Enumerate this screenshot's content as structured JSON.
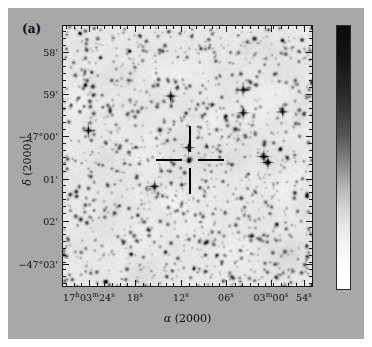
{
  "figure": {
    "panel_label": "(a)",
    "background_color": "#a8a8a8",
    "frame_color": "#1a1a1a"
  },
  "axes": {
    "xlabel_alpha": "α",
    "xlabel_epoch": "(2000)",
    "ylabel_delta": "δ",
    "ylabel_epoch": "(2000)"
  },
  "xticks": [
    {
      "label_main": "17",
      "sup1": "h",
      "label_mid": "03",
      "sup2": "m",
      "label_end": "24",
      "sup3": "s",
      "px": 89
    },
    {
      "label_main": "",
      "sup1": "",
      "label_mid": "",
      "sup2": "",
      "label_end": "18",
      "sup3": "s",
      "px": 135
    },
    {
      "label_main": "",
      "sup1": "",
      "label_mid": "",
      "sup2": "",
      "label_end": "12",
      "sup3": "s",
      "px": 181
    },
    {
      "label_main": "",
      "sup1": "",
      "label_mid": "",
      "sup2": "",
      "label_end": "06",
      "sup3": "s",
      "px": 226
    },
    {
      "label_main": "",
      "sup1": "",
      "label_mid": "03",
      "sup2": "m",
      "label_end": "00",
      "sup3": "s",
      "px": 271
    },
    {
      "label_main": "",
      "sup1": "",
      "label_mid": "",
      "sup2": "",
      "label_end": "54",
      "sup3": "s",
      "px": 304
    }
  ],
  "yticks": [
    {
      "label": "58'",
      "px": 52
    },
    {
      "label": "59'",
      "px": 94
    },
    {
      "label": "−47°00'",
      "px": 136
    },
    {
      "label": "01'",
      "px": 179
    },
    {
      "label": "02'",
      "px": 221
    },
    {
      "label": "−47°03'",
      "px": 264
    }
  ],
  "marker": {
    "name": "crosshair-target",
    "center_x": 189,
    "center_y": 159,
    "arm_length": 26,
    "gap": 8,
    "color": "#000000"
  },
  "colorbar": {
    "orientation": "vertical",
    "top_color": "#0a0a0a",
    "bottom_color": "#ffffff",
    "has_ticks": false
  },
  "chart_data": {
    "type": "scatter",
    "title": "(a)",
    "xlabel": "α (2000)",
    "ylabel": "δ (2000)",
    "grid": false,
    "legend": "none",
    "x_tick_labels": [
      "17h03m24s",
      "18s",
      "12s",
      "06s",
      "03m00s",
      "54s"
    ],
    "y_tick_labels": [
      "58'",
      "59'",
      "-47°00'",
      "01'",
      "02'",
      "-47°03'"
    ],
    "xlim": [
      "17h03m27s",
      "17h02m51s"
    ],
    "ylim": [
      "-47°03'30\"",
      "-46°57'30\""
    ],
    "marker_position": {
      "ra": "17h03m10s",
      "dec": "-47°00'30\""
    },
    "bright_stars": [
      [
        0.093,
        0.09,
        2.0
      ],
      [
        0.306,
        0.036,
        1.9
      ],
      [
        0.552,
        0.085,
        1.8
      ],
      [
        0.767,
        0.047,
        2.8
      ],
      [
        0.118,
        0.231,
        2.7
      ],
      [
        0.382,
        0.204,
        2.0
      ],
      [
        0.432,
        0.268,
        3.6
      ],
      [
        0.723,
        0.243,
        3.2
      ],
      [
        0.262,
        0.207,
        1.6
      ],
      [
        0.88,
        0.327,
        3.0
      ],
      [
        0.722,
        0.333,
        3.3
      ],
      [
        0.101,
        0.4,
        3.4
      ],
      [
        0.387,
        0.398,
        2.8
      ],
      [
        0.69,
        0.395,
        2.6
      ],
      [
        0.503,
        0.467,
        3.0
      ],
      [
        0.574,
        0.462,
        1.7
      ],
      [
        0.803,
        0.5,
        3.8
      ],
      [
        0.82,
        0.523,
        3.4
      ],
      [
        0.393,
        0.556,
        1.6
      ],
      [
        0.365,
        0.616,
        3.2
      ],
      [
        0.051,
        0.635,
        2.4
      ],
      [
        0.028,
        0.646,
        2.2
      ],
      [
        0.929,
        0.64,
        2.3
      ],
      [
        0.714,
        0.66,
        2.2
      ],
      [
        0.205,
        0.718,
        2.1
      ],
      [
        0.069,
        0.742,
        2.5
      ],
      [
        0.094,
        0.755,
        2.2
      ],
      [
        0.856,
        0.762,
        2.4
      ],
      [
        0.757,
        0.805,
        2.6
      ],
      [
        0.577,
        0.828,
        2.2
      ],
      [
        0.272,
        0.876,
        1.9
      ],
      [
        0.636,
        0.905,
        1.7
      ],
      [
        0.437,
        0.94,
        1.6
      ],
      [
        0.178,
        0.303,
        1.5
      ],
      [
        0.612,
        0.133,
        1.5
      ],
      [
        0.245,
        0.527,
        1.4
      ],
      [
        0.54,
        0.3,
        1.3
      ],
      [
        0.64,
        0.596,
        1.4
      ]
    ]
  }
}
